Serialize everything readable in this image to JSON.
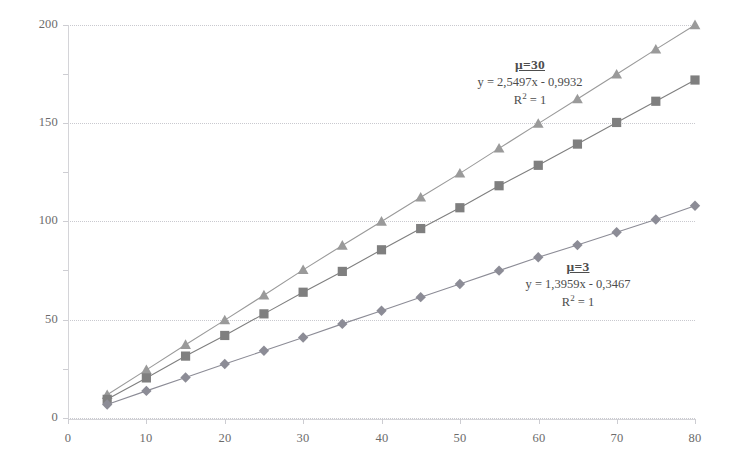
{
  "chart_data": {
    "type": "line",
    "title": "",
    "xlabel": "",
    "ylabel": "",
    "xlim": [
      0,
      80
    ],
    "ylim": [
      0,
      200
    ],
    "grid": true,
    "legend_position": "none",
    "x_ticks": [
      "0",
      "10",
      "20",
      "30",
      "40",
      "50",
      "60",
      "70",
      "80"
    ],
    "y_ticks": [
      "0",
      "50",
      "100",
      "150",
      "200"
    ],
    "x": [
      5,
      10,
      15,
      20,
      25,
      30,
      35,
      40,
      45,
      50,
      55,
      60,
      65,
      70,
      75,
      80
    ],
    "series": [
      {
        "name": "mu=30",
        "marker": "triangle",
        "color": "#9a9a9a",
        "values": [
          11.8,
          24.5,
          37.3,
          49.8,
          62.5,
          75.4,
          87.8,
          100.0,
          112.3,
          124.5,
          137.2,
          149.8,
          162.3,
          174.9,
          187.6,
          200.0
        ]
      },
      {
        "name": "mu=3-upper-mid",
        "marker": "square",
        "color": "#7f7f7f",
        "values": [
          9.5,
          20.4,
          31.5,
          42.0,
          53.0,
          64.0,
          74.6,
          85.6,
          96.4,
          107.0,
          118.2,
          128.6,
          139.4,
          150.4,
          161.2,
          172.0
        ]
      },
      {
        "name": "mu=3",
        "marker": "diamond",
        "color": "#8c8c96",
        "values": [
          6.9,
          13.8,
          20.6,
          27.5,
          34.2,
          41.0,
          47.9,
          54.6,
          61.5,
          68.2,
          75.0,
          81.8,
          88.0,
          94.5,
          101.0,
          108.0
        ]
      }
    ],
    "annotations": [
      {
        "id": "mu30",
        "mu_label": "μ=30",
        "equation": "y = 2,5497x - 0,9932",
        "r2_prefix": "R",
        "r2_exp": "2",
        "r2_value": " = 1"
      },
      {
        "id": "mu3",
        "mu_label": "μ=3",
        "equation": "y = 1,3959x - 0,3467",
        "r2_prefix": "R",
        "r2_exp": "2",
        "r2_value": " = 1"
      }
    ]
  }
}
